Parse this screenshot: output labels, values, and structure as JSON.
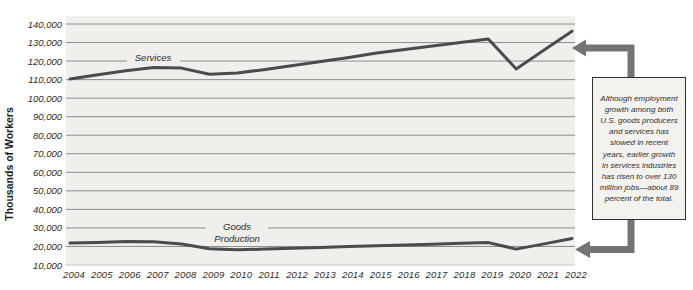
{
  "chart_data": {
    "type": "line",
    "title": "",
    "xlabel": "",
    "ylabel": "Thousands of Workers",
    "x": [
      2004,
      2005,
      2006,
      2007,
      2008,
      2009,
      2010,
      2011,
      2012,
      2013,
      2014,
      2015,
      2016,
      2017,
      2018,
      2019,
      2020,
      2021,
      2022
    ],
    "ylim": [
      10000,
      140000
    ],
    "ytick_step": 10000,
    "grid": true,
    "legend_position": "inline-labels",
    "series": [
      {
        "name": "Services",
        "label_lines": [
          "Services"
        ],
        "values": [
          110400,
          112600,
          114800,
          116600,
          116200,
          112900,
          113500,
          115500,
          117600,
          119700,
          122000,
          124300,
          126300,
          128200,
          130100,
          131900,
          115800,
          126000,
          136100
        ]
      },
      {
        "name": "Goods Production",
        "label_lines": [
          "Goods",
          "Production"
        ],
        "values": [
          21800,
          22200,
          22600,
          22500,
          21400,
          18800,
          18200,
          18600,
          19000,
          19400,
          19900,
          20400,
          20800,
          21200,
          21700,
          22100,
          18600,
          21400,
          24300
        ]
      }
    ],
    "colors": {
      "line": "#4b4b4b",
      "grid": "#8c8c8c",
      "plot_bg": "#f1efec",
      "plot_edge": "#c9c6c2",
      "text": "#2b2b2b"
    }
  },
  "annotation": {
    "text": "Although employment growth among both U.S. goods producers and services has slowed in recent years, earlier growth in services industries has risen to over 130 million jobs—about 89 percent of the total.",
    "arrow_color": "#747474",
    "box_bg": "#f4f2ef",
    "box_border": "#2f2f2f"
  }
}
